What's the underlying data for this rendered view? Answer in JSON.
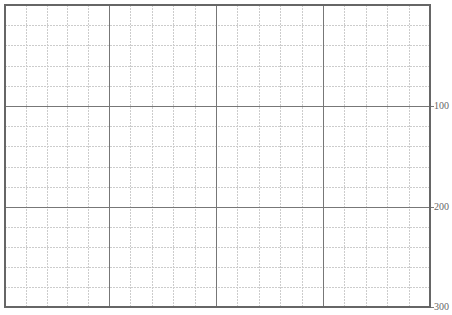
{
  "chart_data": {
    "type": "table",
    "title": "",
    "xlabel": "",
    "ylabel": "",
    "grid": true,
    "frame": {
      "left": 5,
      "top": 5,
      "right": 430,
      "bottom": 307
    },
    "major_x": [
      109,
      216,
      323
    ],
    "major_y": [
      106,
      207
    ],
    "minor_per_major": 5,
    "y_axis_side": "right",
    "y_ticks": [
      {
        "value": 100,
        "label": "100",
        "y": 106
      },
      {
        "value": 200,
        "label": "200",
        "y": 207
      },
      {
        "value": 300,
        "label": "300",
        "y": 307
      }
    ],
    "ylim": [
      0,
      300
    ],
    "colors": {
      "frame": "#666666",
      "major": "#777777",
      "minor": "#cccccc",
      "label": "#666666"
    }
  },
  "axis": {
    "tick_100": "100",
    "tick_200": "200",
    "tick_300": "300"
  }
}
